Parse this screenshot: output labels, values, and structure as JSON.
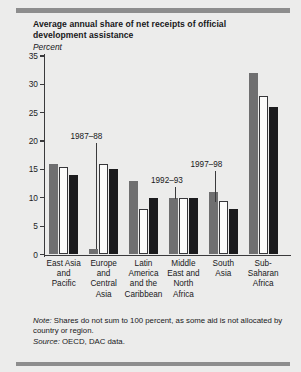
{
  "figure": {
    "title": "Average annual share of net receipts of official development assistance",
    "subtitle": "Percent",
    "note_label": "Note:",
    "note_text": " Shares do not sum to 100 percent, as some aid is not allocated by country or region.",
    "source_label": "Source:",
    "source_text": " OECD, DAC data."
  },
  "chart_data": {
    "type": "bar",
    "title": "Average annual share of net receipts of official development assistance",
    "xlabel": "",
    "ylabel": "Percent",
    "ylim": [
      0,
      35
    ],
    "yticks": [
      "0",
      "5",
      "10",
      "15",
      "20",
      "25",
      "30",
      "35"
    ],
    "grid": false,
    "legend_position": "annotations",
    "categories": [
      "East Asia and Pacific",
      "Europe and Central Asia",
      "Latin America and the Caribbean",
      "Middle East and North Africa",
      "South Asia",
      "Sub-Saharan Africa"
    ],
    "category_lines": [
      [
        "East Asia",
        "and",
        "Pacific"
      ],
      [
        "Europe",
        "and",
        "Central",
        "Asia"
      ],
      [
        "Latin",
        "America",
        "and the",
        "Caribbean"
      ],
      [
        "Middle",
        "East and",
        "North",
        "Africa"
      ],
      [
        "South",
        "Asia"
      ],
      [
        "Sub-",
        "Saharan",
        "Africa"
      ]
    ],
    "series": [
      {
        "name": "1987-88",
        "color": "#6f6f70",
        "values": [
          16.0,
          1.0,
          13.0,
          10.0,
          11.0,
          32.0
        ]
      },
      {
        "name": "1992-93",
        "color": "#fbfbfa",
        "values": [
          15.5,
          16.0,
          8.0,
          10.0,
          9.5,
          28.0
        ]
      },
      {
        "name": "1997-98",
        "color": "#1b1b1d",
        "values": [
          14.0,
          15.0,
          10.0,
          10.0,
          8.0,
          26.0
        ]
      }
    ],
    "annotations": [
      {
        "text": "1987–88",
        "series": "1987-88"
      },
      {
        "text": "1992–93",
        "series": "1992-93"
      },
      {
        "text": "1997–98",
        "series": "1997-98"
      }
    ]
  }
}
